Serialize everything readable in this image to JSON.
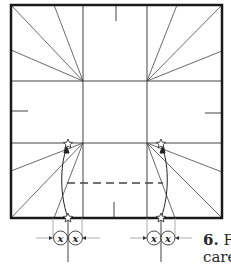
{
  "figure": {
    "step_number": "6.",
    "caption_line1": "F",
    "caption_line2": "caref",
    "symbols": {
      "reference_marker": "star-icon",
      "distance_marker_left": "x",
      "distance_marker_right": "x"
    },
    "colors": {
      "outline": "#1a1a1a",
      "crease": "#444444",
      "guide": "#999999",
      "background": "#ffffff"
    }
  }
}
